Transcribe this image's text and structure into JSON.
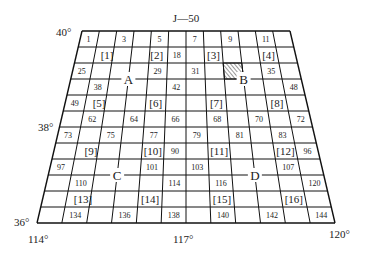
{
  "title": "J—50",
  "lat_labels": {
    "top": "40°",
    "mid": "38°",
    "bottom": "36°"
  },
  "lon_labels": {
    "left": "114°",
    "mid": "117°",
    "right": "120°"
  },
  "grid": {
    "rows": 12,
    "cols": 12,
    "top_y": 31,
    "bottom_y": 223,
    "top_left_x": 82,
    "top_right_x": 290,
    "bottom_left_x": 37,
    "bottom_right_x": 335
  },
  "cell_numbers": [
    {
      "t": "1",
      "r": 0,
      "c": 0
    },
    {
      "t": "3",
      "r": 0,
      "c": 2
    },
    {
      "t": "5",
      "r": 0,
      "c": 4
    },
    {
      "t": "7",
      "r": 0,
      "c": 6
    },
    {
      "t": "9",
      "r": 0,
      "c": 8
    },
    {
      "t": "11",
      "r": 0,
      "c": 10
    },
    {
      "t": "18",
      "r": 1,
      "c": 5
    },
    {
      "t": "25",
      "r": 2,
      "c": 0
    },
    {
      "t": "29",
      "r": 2,
      "c": 4
    },
    {
      "t": "31",
      "r": 2,
      "c": 6
    },
    {
      "t": "35",
      "r": 2,
      "c": 10
    },
    {
      "t": "38",
      "r": 3,
      "c": 1
    },
    {
      "t": "42",
      "r": 3,
      "c": 5
    },
    {
      "t": "48",
      "r": 3,
      "c": 11
    },
    {
      "t": "49",
      "r": 4,
      "c": 0
    },
    {
      "t": "62",
      "r": 5,
      "c": 1
    },
    {
      "t": "64",
      "r": 5,
      "c": 3
    },
    {
      "t": "66",
      "r": 5,
      "c": 5
    },
    {
      "t": "68",
      "r": 5,
      "c": 7
    },
    {
      "t": "70",
      "r": 5,
      "c": 9
    },
    {
      "t": "72",
      "r": 5,
      "c": 11
    },
    {
      "t": "73",
      "r": 6,
      "c": 0
    },
    {
      "t": "75",
      "r": 6,
      "c": 2
    },
    {
      "t": "77",
      "r": 6,
      "c": 4
    },
    {
      "t": "79",
      "r": 6,
      "c": 6
    },
    {
      "t": "81",
      "r": 6,
      "c": 8
    },
    {
      "t": "83",
      "r": 6,
      "c": 10
    },
    {
      "t": "90",
      "r": 7,
      "c": 5
    },
    {
      "t": "96",
      "r": 7,
      "c": 11
    },
    {
      "t": "97",
      "r": 8,
      "c": 0
    },
    {
      "t": "101",
      "r": 8,
      "c": 4
    },
    {
      "t": "103",
      "r": 8,
      "c": 6
    },
    {
      "t": "107",
      "r": 8,
      "c": 10
    },
    {
      "t": "110",
      "r": 9,
      "c": 1
    },
    {
      "t": "114",
      "r": 9,
      "c": 5
    },
    {
      "t": "116",
      "r": 9,
      "c": 7
    },
    {
      "t": "120",
      "r": 9,
      "c": 11
    },
    {
      "t": "134",
      "r": 11,
      "c": 1
    },
    {
      "t": "136",
      "r": 11,
      "c": 3
    },
    {
      "t": "138",
      "r": 11,
      "c": 5
    },
    {
      "t": "140",
      "r": 11,
      "c": 7
    },
    {
      "t": "142",
      "r": 11,
      "c": 9
    },
    {
      "t": "144",
      "r": 11,
      "c": 11
    }
  ],
  "bracket_labels": [
    {
      "t": "[1]",
      "r": 1,
      "c": 1.2
    },
    {
      "t": "[2]",
      "r": 1,
      "c": 3.9
    },
    {
      "t": "[3]",
      "r": 1,
      "c": 7
    },
    {
      "t": "[4]",
      "r": 1,
      "c": 10
    },
    {
      "t": "[5]",
      "r": 4,
      "c": 1.2
    },
    {
      "t": "[6]",
      "r": 4,
      "c": 4
    },
    {
      "t": "[7]",
      "r": 4,
      "c": 7
    },
    {
      "t": "[8]",
      "r": 4,
      "c": 10
    },
    {
      "t": "[9]",
      "r": 7,
      "c": 1.2
    },
    {
      "t": "[10]",
      "r": 7,
      "c": 4
    },
    {
      "t": "[11]",
      "r": 7,
      "c": 7
    },
    {
      "t": "[12]",
      "r": 7,
      "c": 10
    },
    {
      "t": "[13]",
      "r": 10,
      "c": 1.2
    },
    {
      "t": "[14]",
      "r": 10,
      "c": 4
    },
    {
      "t": "[15]",
      "r": 10,
      "c": 7
    },
    {
      "t": "[16]",
      "r": 10,
      "c": 10
    }
  ],
  "letters": [
    {
      "t": "A",
      "row_line": 3,
      "col_line": 3
    },
    {
      "t": "B",
      "row_line": 3,
      "col_line": 9
    },
    {
      "t": "C",
      "row_line": 9,
      "col_line": 3
    },
    {
      "t": "D",
      "row_line": 9,
      "col_line": 9
    }
  ],
  "hatched_cell": {
    "r": 2,
    "c": 8
  }
}
